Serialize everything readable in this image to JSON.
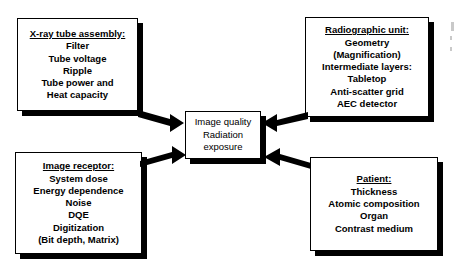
{
  "diagram": {
    "center": {
      "lines": [
        "Image quality",
        "Radiation",
        "exposure"
      ]
    },
    "nodes": [
      {
        "id": "xray-tube-assembly",
        "header": "X-ray tube assembly:",
        "items": [
          "Filter",
          "Tube voltage",
          "Ripple",
          "Tube power and",
          "Heat capacity"
        ]
      },
      {
        "id": "radiographic-unit",
        "header": "Radiographic unit:",
        "items": [
          "Geometry",
          "(Magnification)",
          "Intermediate layers:",
          "Tabletop",
          "Anti-scatter grid",
          "AEC detector"
        ]
      },
      {
        "id": "image-receptor",
        "header": "Image receptor:",
        "items": [
          "System dose",
          "Energy dependence",
          "Noise",
          "DQE",
          "Digitization",
          "(Bit depth, Matrix)"
        ]
      },
      {
        "id": "patient",
        "header": "Patient:",
        "items": [
          "Thickness",
          "Atomic composition",
          "Organ",
          "Contrast medium"
        ]
      }
    ],
    "arrows": [
      {
        "id": "arrow-xray-to-center",
        "from": "xray-tube-assembly",
        "to": "center",
        "direction": "down-right"
      },
      {
        "id": "arrow-radunit-to-center",
        "from": "radiographic-unit",
        "to": "center",
        "direction": "down-left"
      },
      {
        "id": "arrow-receptor-to-center",
        "from": "image-receptor",
        "to": "center",
        "direction": "up-right"
      },
      {
        "id": "arrow-patient-to-center",
        "from": "patient",
        "to": "center",
        "direction": "up-left"
      }
    ],
    "colors": {
      "stroke": "#000000",
      "fill": "#ffffff",
      "shadow": "#000000",
      "background": "#ffffff"
    }
  }
}
